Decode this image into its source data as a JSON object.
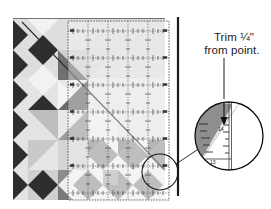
{
  "figure": {
    "kind": "quilting-instruction-diagram"
  },
  "caption": {
    "line1": "Trim ¼\"",
    "line2": "from point."
  },
  "magnifier": {
    "tick_labels": [
      "14",
      "13"
    ],
    "callout_arrow": "down-arrow-to-point"
  },
  "ruler": {
    "type": "transparent-gridded-quilting-ruler",
    "grid_major_cells_x": 5,
    "grid_major_cells_y": 6,
    "edge_tick_marks": true
  },
  "cutter": {
    "label": "rotary-cutter-blade-edge"
  },
  "colors": {
    "dark": "#2e2e2e",
    "mid_dark": "#6f6f6f",
    "mid": "#9a9a9a",
    "light": "#d8d8d8",
    "pale": "#ececec",
    "white": "#ffffff",
    "line": "#222222",
    "grid": "#707070",
    "text": "#1c1c1c"
  },
  "quilt": {
    "motif": "diamond-and-half-square-triangle-blocks",
    "rows": 6,
    "columns": 5
  }
}
